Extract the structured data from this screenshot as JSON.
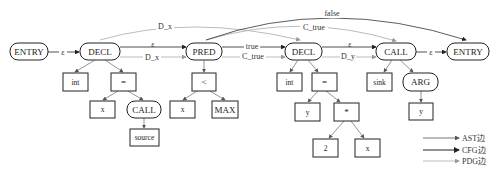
{
  "diagram": {
    "type": "code property graph",
    "cfg_nodes": [
      {
        "id": "entry",
        "label": "ENTRY"
      },
      {
        "id": "decl1",
        "label": "DECL"
      },
      {
        "id": "pred",
        "label": "PRED"
      },
      {
        "id": "decl2",
        "label": "DECL"
      },
      {
        "id": "call",
        "label": "CALL"
      },
      {
        "id": "exit",
        "label": "ENTRY"
      }
    ],
    "ast_nodes": {
      "decl1_type": "int",
      "decl1_assign": "=",
      "decl1_lhs": "x",
      "decl1_call": "CALL",
      "decl1_callee": "source",
      "pred_op": "<",
      "pred_lhs": "x",
      "pred_rhs": "MAX",
      "decl2_type": "int",
      "decl2_assign": "=",
      "decl2_lhs": "y",
      "decl2_mul": "*",
      "decl2_mul_lhs": "2",
      "decl2_mul_rhs": "x",
      "call_callee": "sink",
      "call_arg": "ARG",
      "call_arg_val": "y"
    },
    "edge_labels": {
      "entry_decl1": "ε",
      "decl1_pred_cfg": "ε",
      "decl1_pred_pdg": "D_x",
      "pred_decl2_cfg": "true",
      "pred_decl2_pdg": "C_true",
      "decl2_call_cfg": "ε",
      "decl2_call_pdg": "D_y",
      "call_exit": "ε",
      "arc_dx": "D_x",
      "arc_ctrue": "C_true",
      "arc_false": "false"
    },
    "legend": [
      {
        "label": "AST边",
        "color": "#555555"
      },
      {
        "label": "CFG边",
        "color": "#222222"
      },
      {
        "label": "PDG边",
        "color": "#aaaaaa"
      }
    ]
  }
}
